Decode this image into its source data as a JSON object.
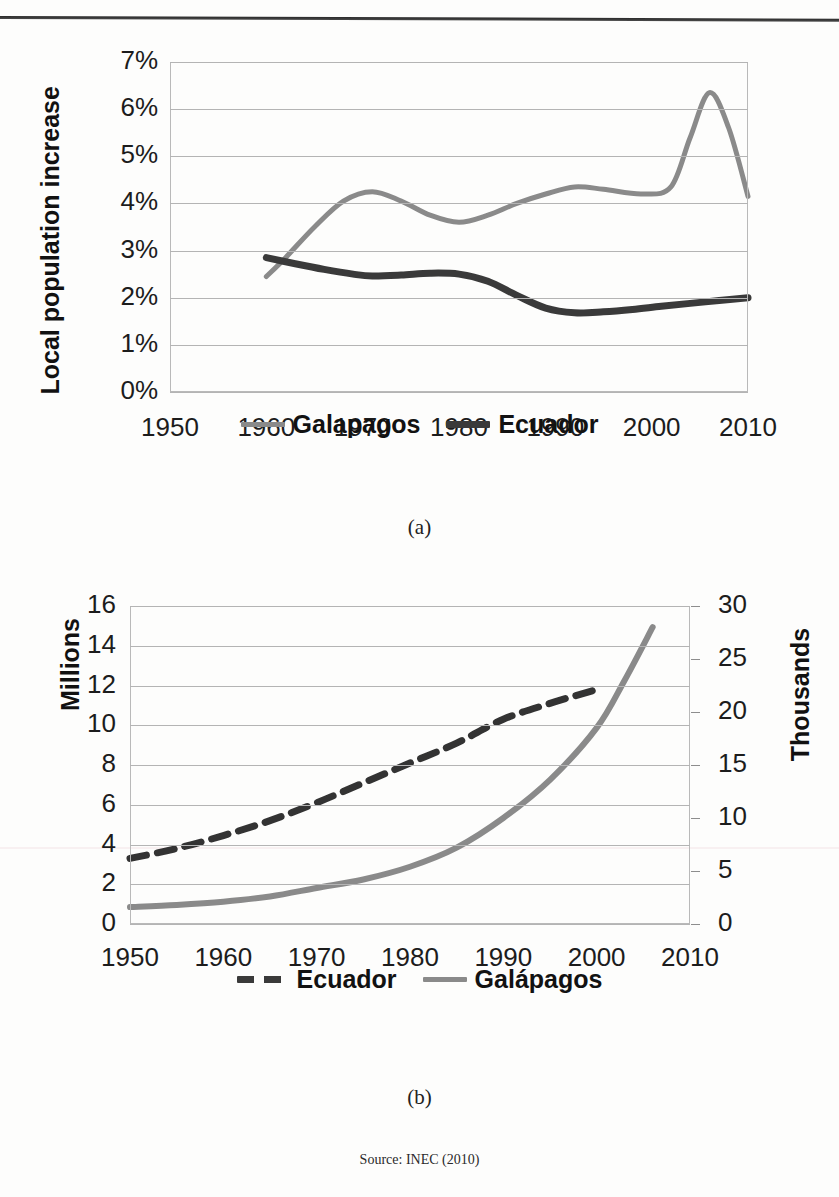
{
  "source_note": "Source: INEC (2010)",
  "panels": [
    {
      "caption": "(a)",
      "legend": [
        {
          "label": "Galapagos",
          "style": "solid-gray"
        },
        {
          "label": "Ecuador",
          "style": "solid-dark"
        }
      ]
    },
    {
      "caption": "(b)",
      "legend": [
        {
          "label": "Ecuador",
          "style": "dashed-dark"
        },
        {
          "label": "Galápagos",
          "style": "solid-gray"
        }
      ]
    }
  ],
  "chart_data": [
    {
      "type": "line",
      "panel": "(a)",
      "title": "",
      "xlabel": "",
      "ylabel": "Local population increase",
      "xlim": [
        1950,
        2010
      ],
      "ylim": [
        0,
        0.07
      ],
      "grid": true,
      "legend_position": "bottom",
      "xtick_labels": [
        "1950",
        "1960",
        "1970",
        "1980",
        "1990",
        "2000",
        "2010"
      ],
      "xticks": [
        1950,
        1960,
        1970,
        1980,
        1990,
        2000,
        2010
      ],
      "ytick_labels": [
        "0%",
        "1%",
        "2%",
        "3%",
        "4%",
        "5%",
        "6%",
        "7%"
      ],
      "yticks": [
        0,
        1,
        2,
        3,
        4,
        5,
        6,
        7
      ],
      "series": [
        {
          "name": "Galapagos",
          "color": "#8a8a8a",
          "linestyle": "solid",
          "x": [
            1960,
            1962,
            1965,
            1968,
            1971,
            1974,
            1977,
            1980,
            1983,
            1986,
            1989,
            1992,
            1995,
            1999,
            2002,
            2004,
            2006,
            2008,
            2010
          ],
          "values": [
            2.45,
            2.85,
            3.5,
            4.05,
            4.25,
            4.05,
            3.75,
            3.6,
            3.75,
            4.0,
            4.2,
            4.35,
            4.3,
            4.2,
            4.35,
            5.4,
            6.35,
            5.6,
            4.15
          ]
        },
        {
          "name": "Ecuador",
          "color": "#3a3a3a",
          "linestyle": "solid",
          "x": [
            1960,
            1963,
            1966,
            1969,
            1971,
            1974,
            1977,
            1980,
            1983,
            1986,
            1989,
            1992,
            1995,
            1998,
            2001,
            2004,
            2007,
            2010
          ],
          "values": [
            2.85,
            2.72,
            2.6,
            2.5,
            2.46,
            2.48,
            2.52,
            2.5,
            2.35,
            2.05,
            1.78,
            1.68,
            1.7,
            1.75,
            1.82,
            1.88,
            1.94,
            2.0
          ]
        }
      ]
    },
    {
      "type": "line",
      "panel": "(b)",
      "title": "",
      "xlabel": "",
      "ylabel_left": "Millions",
      "ylabel_right": "Thousands",
      "xlim": [
        1950,
        2010
      ],
      "ylim_left": [
        0,
        16
      ],
      "ylim_right": [
        0,
        30
      ],
      "grid": true,
      "legend_position": "bottom",
      "xtick_labels": [
        "1950",
        "1960",
        "1970",
        "1980",
        "1990",
        "2000",
        "2010"
      ],
      "xticks": [
        1950,
        1960,
        1970,
        1980,
        1990,
        2000,
        2010
      ],
      "ytick_labels_left": [
        "0",
        "2",
        "4",
        "6",
        "8",
        "10",
        "12",
        "14",
        "16"
      ],
      "yticks_left": [
        0,
        2,
        4,
        6,
        8,
        10,
        12,
        14,
        16
      ],
      "ytick_labels_right": [
        "0",
        "5",
        "10",
        "15",
        "20",
        "25",
        "30"
      ],
      "yticks_right": [
        0,
        5,
        10,
        15,
        20,
        25,
        30
      ],
      "series": [
        {
          "name": "Ecuador",
          "axis": "left",
          "units": "Millions",
          "color": "#333333",
          "linestyle": "dashed",
          "x": [
            1950,
            1955,
            1960,
            1965,
            1970,
            1975,
            1980,
            1985,
            1990,
            1995,
            2000
          ],
          "values": [
            3.3,
            3.8,
            4.45,
            5.2,
            6.1,
            7.1,
            8.1,
            9.1,
            10.3,
            11.1,
            11.8
          ]
        },
        {
          "name": "Galápagos",
          "axis": "right",
          "units": "Thousands",
          "color": "#8a8a8a",
          "linestyle": "solid",
          "x": [
            1950,
            1955,
            1960,
            1965,
            1970,
            1975,
            1980,
            1985,
            1990,
            1995,
            2000,
            2003,
            2006
          ],
          "values": [
            1.6,
            1.8,
            2.1,
            2.6,
            3.4,
            4.2,
            5.4,
            7.2,
            10.0,
            13.6,
            18.5,
            23.0,
            28.0
          ]
        }
      ]
    }
  ]
}
